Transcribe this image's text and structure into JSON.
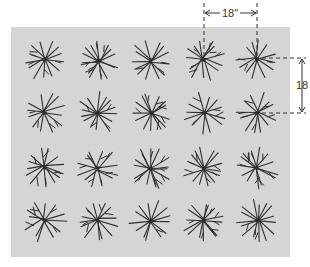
{
  "diagram": {
    "background_color": "#d5d5d5",
    "plant_color": "#2e2e2e",
    "grid": {
      "rows": 4,
      "columns": 5,
      "column_centers_px": [
        45,
        98,
        151,
        204,
        257
      ],
      "row_centers_px": [
        60,
        113,
        168,
        221
      ]
    },
    "dimensions": {
      "horizontal_spacing_label": "18\"",
      "vertical_spacing_label": "18"
    }
  }
}
